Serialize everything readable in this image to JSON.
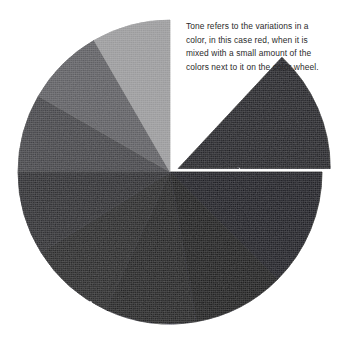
{
  "page": {
    "background_color": "#ffffff",
    "width": 343,
    "height": 342
  },
  "caption": {
    "text": "Tone refers to the variations in a color, in this case red, when it is mixed with a small amount of the colors next to it on the color wheel.",
    "lines": [
      "Tone refers to the variations in a",
      "color, in this case red, when it is",
      "mixed with a small amount of the",
      "colors next to it on the color wheel."
    ],
    "color": "#2b2b2b"
  },
  "chart_data": {
    "type": "pie",
    "title": "",
    "subtitle": "",
    "xlabel": "",
    "ylabel": "",
    "legend_position": "none",
    "grid": false,
    "center": {
      "x": 170,
      "y": 172
    },
    "radius": 152,
    "categories": [
      "tone-1-exploded",
      "tone-2",
      "tone-3",
      "tone-4",
      "tone-5",
      "tone-6",
      "tone-7",
      "tone-8",
      "tone-9",
      "gap"
    ],
    "values": [
      12,
      13,
      13,
      13,
      13,
      12,
      12,
      12,
      12,
      12
    ],
    "slices": [
      {
        "label": "tone-1-exploded",
        "start_angle": 43,
        "end_angle": 90,
        "value": 13,
        "color": "#16161a",
        "exploded": true,
        "explode_offset": 9
      },
      {
        "label": "tone-2",
        "start_angle": 90,
        "end_angle": 135,
        "value": 12,
        "color": "#101013",
        "exploded": false,
        "explode_offset": 0
      },
      {
        "label": "tone-3",
        "start_angle": 135,
        "end_angle": 170,
        "value": 10,
        "color": "#0d0d10",
        "exploded": false,
        "explode_offset": 0
      },
      {
        "label": "tone-4",
        "start_angle": 170,
        "end_angle": 205,
        "value": 10,
        "color": "#121216",
        "exploded": false,
        "explode_offset": 0
      },
      {
        "label": "tone-5",
        "start_angle": 205,
        "end_angle": 238,
        "value": 9,
        "color": "#1b1b1f",
        "exploded": false,
        "explode_offset": 0
      },
      {
        "label": "tone-6",
        "start_angle": 238,
        "end_angle": 270,
        "value": 9,
        "color": "#242428",
        "exploded": false,
        "explode_offset": 0
      },
      {
        "label": "tone-7",
        "start_angle": 270,
        "end_angle": 300,
        "value": 8,
        "color": "#3e3e42",
        "exploded": false,
        "explode_offset": 0
      },
      {
        "label": "tone-8",
        "start_angle": 300,
        "end_angle": 330,
        "value": 8,
        "color": "#5a5a5e",
        "exploded": false,
        "explode_offset": 0
      },
      {
        "label": "tone-9",
        "start_angle": 330,
        "end_angle": 360,
        "value": 8,
        "color": "#9a9a9c",
        "exploded": false,
        "explode_offset": 0
      },
      {
        "label": "gap",
        "start_angle": 0,
        "end_angle": 43,
        "value": 12,
        "color": "#ffffff",
        "exploded": false,
        "explode_offset": 0
      }
    ],
    "palette": [
      "#16161a",
      "#101013",
      "#0d0d10",
      "#121216",
      "#1b1b1f",
      "#242428",
      "#3e3e42",
      "#5a5a5e",
      "#9a9a9c",
      "#ffffff"
    ]
  }
}
